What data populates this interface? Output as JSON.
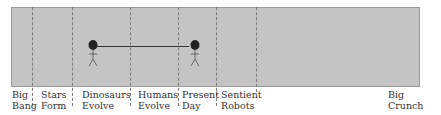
{
  "timeline": {
    "events": [
      {
        "label_line1": "Big",
        "label_line2": "Bang",
        "x": 12
      },
      {
        "label_line1": "Stars",
        "label_line2": "Form",
        "x": 41
      },
      {
        "label_line1": "Dinosaurs",
        "label_line2": "Evolve",
        "x": 82
      },
      {
        "label_line1": "Humans",
        "label_line2": "Evolve",
        "x": 138
      },
      {
        "label_line1": "Present",
        "label_line2": "Day",
        "x": 182
      },
      {
        "label_line1": "Sentient",
        "label_line2": "Robots",
        "x": 221
      }
    ],
    "end_label": "Big Crunch",
    "figures": [
      {
        "name": "figure-at-dinosaurs",
        "x": 88
      },
      {
        "name": "figure-at-present",
        "x": 189
      }
    ],
    "colors": {
      "box": "#c4c4c4",
      "divider": "#7a7a7a",
      "ink": "#333333"
    }
  }
}
